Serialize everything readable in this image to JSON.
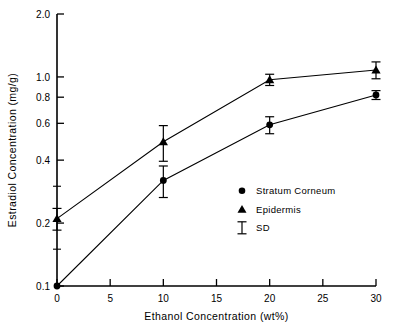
{
  "chart_data": {
    "type": "line",
    "title": "",
    "xlabel": "Ethanol Concentration (wt%)",
    "ylabel": "Estradiol Concentration (mg/g)",
    "xlim": [
      0,
      30
    ],
    "ylim": [
      0.1,
      2.0
    ],
    "yscale": "log",
    "xscale": "linear",
    "grid": false,
    "legend_position": "center-right",
    "x": [
      0,
      10,
      20,
      30
    ],
    "xticks": [
      0,
      5,
      10,
      15,
      20,
      25,
      30
    ],
    "xticklabels": [
      "0",
      "5",
      "10",
      "15",
      "20",
      "25",
      "30"
    ],
    "yticks": [
      0.1,
      0.2,
      0.4,
      0.6,
      0.8,
      1.0,
      2.0
    ],
    "yticklabels": [
      "0.1",
      "0.2",
      "0.4",
      "0.6",
      "0.8",
      "1.0",
      "2.0"
    ],
    "yminorticks": [
      0.15,
      0.3
    ],
    "series": [
      {
        "name": "Stratum Corneum",
        "marker": "circle",
        "values": [
          0.1,
          0.32,
          0.59,
          0.82
        ],
        "errors": [
          0.0,
          0.055,
          0.055,
          0.04
        ]
      },
      {
        "name": "Epidermis",
        "marker": "triangle",
        "values": [
          0.21,
          0.49,
          0.97,
          1.08
        ],
        "errors": [
          0.025,
          0.095,
          0.06,
          0.1
        ]
      }
    ]
  },
  "legend": {
    "entries": [
      {
        "label": "Stratum Corneum",
        "marker": "circle"
      },
      {
        "label": "Epidermis",
        "marker": "triangle"
      },
      {
        "label": "SD",
        "marker": "errorbar"
      }
    ]
  },
  "colors": {
    "ink": "#000000",
    "background": "#ffffff"
  }
}
